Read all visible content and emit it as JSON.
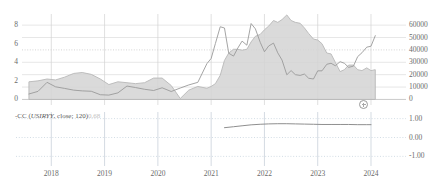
{
  "chart_data": {
    "type": "line",
    "title": "",
    "subtitle": "",
    "xlabel": "",
    "ylabel": "",
    "grid": true,
    "legend_position": "inline-bottom-left",
    "x_tick_labels": [
      "2018",
      "2019",
      "2020",
      "2021",
      "2022",
      "2023",
      "2024"
    ],
    "panels": [
      {
        "name": "price-panel",
        "y_axis_left": {
          "ticks": [
            "0",
            "2",
            "4",
            "6",
            "8"
          ],
          "ylim": [
            -0.6,
            9.2
          ]
        },
        "y_axis_right": {
          "ticks": [
            "0",
            "10000",
            "20000",
            "30000",
            "40000",
            "50000",
            "60000"
          ],
          "ylim": [
            -4500,
            69000
          ]
        },
        "reference_line": {
          "value": 40000,
          "axis": "right",
          "style": "dotted"
        },
        "series": [
          {
            "name": "USIRYY",
            "style": "area",
            "axis": "left",
            "color": "#b8b8b8",
            "fill": "#d4d4d4",
            "x": [
              "2017.58",
              "2017.75",
              "2017.92",
              "2018.08",
              "2018.25",
              "2018.42",
              "2018.58",
              "2018.75",
              "2018.92",
              "2019.08",
              "2019.25",
              "2019.42",
              "2019.58",
              "2019.75",
              "2019.92",
              "2020.08",
              "2020.25",
              "2020.42",
              "2020.58",
              "2020.75",
              "2020.92",
              "2021.00",
              "2021.08",
              "2021.17",
              "2021.25",
              "2021.33",
              "2021.42",
              "2021.50",
              "2021.58",
              "2021.67",
              "2021.75",
              "2021.83",
              "2021.92",
              "2022.00",
              "2022.08",
              "2022.17",
              "2022.25",
              "2022.33",
              "2022.42",
              "2022.50",
              "2022.58",
              "2022.67",
              "2022.75",
              "2022.83",
              "2022.92",
              "2023.00",
              "2023.08",
              "2023.17",
              "2023.25",
              "2023.33",
              "2023.42",
              "2023.50",
              "2023.58",
              "2023.67",
              "2023.75",
              "2023.83",
              "2023.92",
              "2024.00",
              "2024.08"
            ],
            "y": [
              1.9,
              2.0,
              2.2,
              2.1,
              2.4,
              2.8,
              2.9,
              2.7,
              2.2,
              1.6,
              1.9,
              1.8,
              1.7,
              1.8,
              2.3,
              2.3,
              1.5,
              0.1,
              1.0,
              1.4,
              1.2,
              1.4,
              1.7,
              2.6,
              4.2,
              5.0,
              5.4,
              5.4,
              5.3,
              5.4,
              6.2,
              6.8,
              7.0,
              7.5,
              7.9,
              8.5,
              8.3,
              8.6,
              9.1,
              8.5,
              8.3,
              8.2,
              7.7,
              7.1,
              6.5,
              6.4,
              6.0,
              5.0,
              4.9,
              4.0,
              3.0,
              3.2,
              3.7,
              3.7,
              3.2,
              3.1,
              3.4,
              3.1,
              3.2
            ]
          },
          {
            "name": "BTC Price",
            "style": "line",
            "axis": "right",
            "color": "#9a9a9a",
            "x": [
              "2017.58",
              "2017.75",
              "2017.92",
              "2018.08",
              "2018.25",
              "2018.42",
              "2018.58",
              "2018.75",
              "2018.92",
              "2019.08",
              "2019.25",
              "2019.42",
              "2019.58",
              "2019.75",
              "2019.92",
              "2020.08",
              "2020.25",
              "2020.42",
              "2020.58",
              "2020.75",
              "2020.92",
              "2021.00",
              "2021.08",
              "2021.17",
              "2021.25",
              "2021.33",
              "2021.42",
              "2021.50",
              "2021.58",
              "2021.67",
              "2021.75",
              "2021.83",
              "2021.92",
              "2022.00",
              "2022.08",
              "2022.17",
              "2022.25",
              "2022.33",
              "2022.42",
              "2022.50",
              "2022.58",
              "2022.67",
              "2022.75",
              "2022.83",
              "2022.92",
              "2023.00",
              "2023.08",
              "2023.17",
              "2023.25",
              "2023.33",
              "2023.42",
              "2023.50",
              "2023.58",
              "2023.67",
              "2023.75",
              "2023.83",
              "2023.92",
              "2024.00",
              "2024.08"
            ],
            "y": [
              4400,
              6500,
              13800,
              10200,
              8900,
              7500,
              6900,
              6600,
              3800,
              3500,
              5300,
              10800,
              9600,
              8200,
              7200,
              9400,
              6400,
              9200,
              11700,
              13800,
              28900,
              33100,
              45200,
              58700,
              57700,
              37300,
              35000,
              41500,
              47100,
              43800,
              61300,
              57000,
              46200,
              38500,
              43200,
              45500,
              37600,
              31800,
              19900,
              23300,
              20000,
              19400,
              20500,
              17100,
              16500,
              23100,
              23100,
              28400,
              29200,
              27200,
              30500,
              29200,
              25900,
              26900,
              34600,
              37700,
              42200,
              43000,
              51500
            ]
          }
        ]
      },
      {
        "name": "correlation-panel",
        "y_axis_right": {
          "ticks": [
            "1.00",
            "0.00",
            "-1.00"
          ],
          "ylim": [
            -1.35,
            1.35
          ]
        },
        "series": [
          {
            "name": "CC (USIRYY, close; 120)",
            "style": "line",
            "color": "#8f8f8f",
            "x": [
              "2021.25",
              "2021.42",
              "2021.58",
              "2021.75",
              "2021.92",
              "2022.08",
              "2022.25",
              "2022.42",
              "2022.58",
              "2022.75",
              "2022.92",
              "2023.08",
              "2023.25",
              "2023.42",
              "2023.58",
              "2023.75",
              "2023.92",
              "2024.00"
            ],
            "y": [
              0.52,
              0.57,
              0.62,
              0.67,
              0.7,
              0.72,
              0.73,
              0.73,
              0.72,
              0.71,
              0.7,
              0.69,
              0.69,
              0.69,
              0.69,
              0.68,
              0.68,
              0.68
            ]
          }
        ]
      }
    ]
  },
  "legend": {
    "cc_prefix": "-CC (",
    "cc_symbol": "USIRYY",
    "cc_params": ", close; 120)",
    "cc_value": "0.68"
  },
  "cursor": {
    "name": "crosshair-handle"
  }
}
